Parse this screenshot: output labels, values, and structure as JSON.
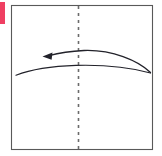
{
  "figure": {
    "description": "Square sheet with a vertical dashed center fold line and a curved arrow pointing left indicating the fold direction.",
    "canvas": {
      "width": 162,
      "height": 156
    },
    "background_color": "#ffffff"
  },
  "accent_bar": {
    "label": "step-accent-marker",
    "color": "#ef3f62",
    "x": 0,
    "y": 2,
    "width": 5,
    "height": 22
  },
  "paper": {
    "label": "Square paper outline",
    "stroke_color": "#595959",
    "fill_color": "#ffffff",
    "stroke_width": 1.1,
    "x": 11.5,
    "y": 5.5,
    "width": 141,
    "height": 144
  },
  "fold_line": {
    "label": "Vertical center fold line",
    "style": "dashed",
    "stroke_color": "#6b6b6b",
    "stroke_width": 1.6,
    "dash_on": 3,
    "dash_off": 4,
    "x": 78.5,
    "y_top": 6,
    "y_bottom": 149
  },
  "curves": [
    {
      "name": "arrow-curve-upper",
      "label": "Curved fold arrow pointing left",
      "stroke_color": "#22222a",
      "stroke_width": 1.3,
      "path": "M 150.5 72.5 C 138 60.5 112 49.5 84 50.5 C 70 51.2 58 53.2 49 55.6",
      "has_arrowhead": true,
      "arrow_direction": "left"
    },
    {
      "name": "edge-curve-lower",
      "label": "Paper edge sweep curve",
      "stroke_color": "#22222a",
      "stroke_width": 1.2,
      "path": "M 150.5 73 C 133 68.2 106 64.6 76 65.4 C 50 66.2 28 70.6 16 75.2",
      "has_arrowhead": false,
      "arrow_direction": "none"
    }
  ],
  "arrowhead": {
    "name": "arrowhead-left",
    "label": "Solid triangular arrowhead pointing left",
    "color": "#22222a",
    "tip_x": 42.5,
    "tip_y": 56.4,
    "points": "42.5,56.4 52.5,52.4 51.6,59.8"
  }
}
